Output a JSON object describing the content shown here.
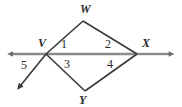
{
  "figure": {
    "type": "geometry-diagram",
    "background_color": "#ffffff",
    "line_color": "#3a3a3a",
    "axis_color": "#808080",
    "text_color": "#2b2b2b"
  },
  "vertex_labels": [
    {
      "id": "W",
      "text": "W",
      "x": 80,
      "y": 3
    },
    {
      "id": "V",
      "text": "V",
      "x": 38,
      "y": 37
    },
    {
      "id": "X",
      "text": "X",
      "x": 142,
      "y": 37
    },
    {
      "id": "Y",
      "text": "Y",
      "x": 79,
      "y": 94
    }
  ],
  "angle_labels": [
    {
      "id": "1",
      "text": "1",
      "x": 61,
      "y": 38
    },
    {
      "id": "2",
      "text": "2",
      "x": 105,
      "y": 38
    },
    {
      "id": "3",
      "text": "3",
      "x": 64,
      "y": 58
    },
    {
      "id": "4",
      "text": "4",
      "x": 107,
      "y": 58
    },
    {
      "id": "5",
      "text": "5",
      "x": 21,
      "y": 59
    }
  ],
  "points": {
    "V": {
      "x": 46,
      "y": 54
    },
    "W": {
      "x": 83,
      "y": 21
    },
    "X": {
      "x": 137,
      "y": 54
    },
    "Y": {
      "x": 85,
      "y": 91
    },
    "horizontal_left_arrow_tip": {
      "x": 7,
      "y": 54
    },
    "horizontal_right_arrow_tip": {
      "x": 175,
      "y": 54
    },
    "lower_left_ray_arrow_tip": {
      "x": 16,
      "y": 89
    }
  },
  "segments": [
    {
      "name": "VW",
      "from": "V",
      "to": "W"
    },
    {
      "name": "WX",
      "from": "W",
      "to": "X"
    },
    {
      "name": "VY",
      "from": "V",
      "to": "Y"
    },
    {
      "name": "YX",
      "from": "Y",
      "to": "X"
    },
    {
      "name": "VX-horizontal",
      "from": "V",
      "to": "X"
    }
  ],
  "rays": [
    {
      "name": "ray-left-horizontal",
      "direction": "left",
      "arrowhead": true
    },
    {
      "name": "ray-right-horizontal",
      "direction": "right",
      "arrowhead": true
    },
    {
      "name": "ray-lower-left",
      "direction": "down-left",
      "arrowhead": true
    }
  ]
}
